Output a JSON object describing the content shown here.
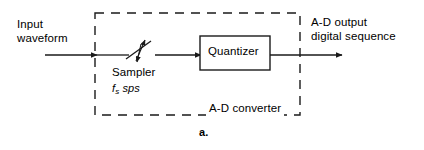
{
  "figure": {
    "caption": "a.",
    "type": "block-diagram"
  },
  "labels": {
    "input_line1": "Input",
    "input_line2": "waveform",
    "output_line1": "A-D output",
    "output_line2": "digital sequence",
    "sampler_name": "Sampler",
    "sampler_rate_symbol": "f",
    "sampler_rate_subscript": "s",
    "sampler_rate_unit": "sps",
    "quantizer": "Quantizer",
    "enclosure": "A-D converter"
  },
  "colors": {
    "stroke": "#1a1a1a",
    "text": "#000000",
    "background": "#ffffff"
  },
  "geometry": {
    "canvas_width": 424,
    "canvas_height": 150,
    "dashed_box": {
      "x": 95,
      "y": 13,
      "width": 205,
      "height": 102
    },
    "quantizer_box": {
      "x": 200,
      "y": 36,
      "width": 70,
      "height": 34
    },
    "signal_y": 55,
    "input_arrow": {
      "from_x": 45,
      "to_x": 96
    },
    "sampler_to_quantizer_arrow": {
      "from_x": 152,
      "to_x": 199
    },
    "output_arrow": {
      "from_x": 270,
      "to_x": 341
    },
    "switch": {
      "pivot_x": 128,
      "pivot_y": 55,
      "blade_end_x": 147,
      "blade_end_y": 42
    }
  }
}
